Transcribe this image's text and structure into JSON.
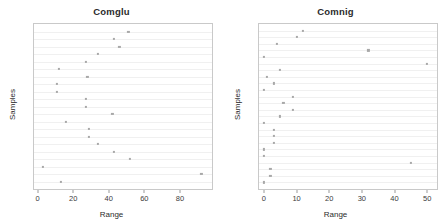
{
  "figure": {
    "background": "#ffffff",
    "marker_color": "#a8a8a8",
    "gridline_color": "#f0f0f0",
    "frame_color": "#c9c9c9"
  },
  "panels": [
    {
      "key": "comglu",
      "title": "Comglu",
      "xlabel": "Range",
      "ylabel": "Samples"
    },
    {
      "key": "comnig",
      "title": "Comnig",
      "xlabel": "Range",
      "ylabel": "Samples"
    }
  ],
  "chart_data": [
    {
      "type": "scatter",
      "title": "Comglu",
      "xlabel": "Range",
      "ylabel": "Samples",
      "xlim": [
        -2,
        98
      ],
      "xticks": [
        0,
        20,
        40,
        60,
        80
      ],
      "xticklabels": [
        "0",
        "20",
        "40",
        "60",
        "80"
      ],
      "yticks": [],
      "yticklabels": [],
      "grid": "horizontal",
      "legend": "none",
      "n_points": 24,
      "values": [
        51,
        43,
        46,
        34,
        27,
        12,
        28,
        11,
        11,
        27,
        27,
        42,
        16,
        34,
        29,
        29,
        43,
        52,
        3,
        92,
        13
      ],
      "points": [
        {
          "x": 51,
          "row": 1
        },
        {
          "x": 43,
          "row": 2
        },
        {
          "x": 46,
          "row": 3
        },
        {
          "x": 34,
          "row": 4
        },
        {
          "x": 27,
          "row": 5
        },
        {
          "x": 12,
          "row": 6
        },
        {
          "x": 28,
          "row": 7
        },
        {
          "x": 11,
          "row": 8
        },
        {
          "x": 11,
          "row": 9
        },
        {
          "x": 27,
          "row": 10
        },
        {
          "x": 27,
          "row": 11
        },
        {
          "x": 42,
          "row": 12
        },
        {
          "x": 16,
          "row": 13
        },
        {
          "x": 29,
          "row": 14
        },
        {
          "x": 29,
          "row": 15
        },
        {
          "x": 34,
          "row": 16
        },
        {
          "x": 43,
          "row": 17
        },
        {
          "x": 52,
          "row": 18
        },
        {
          "x": 3,
          "row": 19
        },
        {
          "x": 92,
          "row": 20
        },
        {
          "x": 13,
          "row": 21
        }
      ]
    },
    {
      "type": "scatter",
      "title": "Comnig",
      "xlabel": "Range",
      "ylabel": "Samples",
      "xlim": [
        -1.5,
        53
      ],
      "xticks": [
        0,
        10,
        20,
        30,
        40,
        50
      ],
      "xticklabels": [
        "0",
        "10",
        "20",
        "30",
        "40",
        "50"
      ],
      "yticks": [],
      "yticklabels": [],
      "grid": "horizontal",
      "legend": "none",
      "n_points": 24,
      "values": [
        12,
        10,
        4,
        32,
        0,
        50,
        5,
        1,
        3,
        0,
        9,
        6,
        9,
        5,
        0,
        3,
        3,
        3,
        0,
        0,
        45,
        2,
        2,
        0
      ],
      "points": [
        {
          "x": 12,
          "row": 1
        },
        {
          "x": 10,
          "row": 2
        },
        {
          "x": 4,
          "row": 3
        },
        {
          "x": 32,
          "row": 4
        },
        {
          "x": 0,
          "row": 5
        },
        {
          "x": 50,
          "row": 6
        },
        {
          "x": 5,
          "row": 7
        },
        {
          "x": 1,
          "row": 8
        },
        {
          "x": 3,
          "row": 9
        },
        {
          "x": 0,
          "row": 10
        },
        {
          "x": 9,
          "row": 11
        },
        {
          "x": 6,
          "row": 12
        },
        {
          "x": 9,
          "row": 13
        },
        {
          "x": 5,
          "row": 14
        },
        {
          "x": 0,
          "row": 15
        },
        {
          "x": 3,
          "row": 16
        },
        {
          "x": 3,
          "row": 17
        },
        {
          "x": 3,
          "row": 18
        },
        {
          "x": 0,
          "row": 19
        },
        {
          "x": 0,
          "row": 20
        },
        {
          "x": 45,
          "row": 21
        },
        {
          "x": 2,
          "row": 22
        },
        {
          "x": 2,
          "row": 23
        },
        {
          "x": 0,
          "row": 24
        }
      ]
    }
  ]
}
